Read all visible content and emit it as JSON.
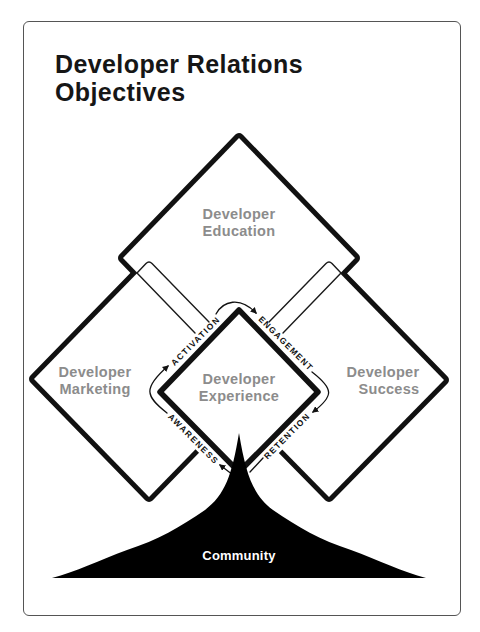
{
  "title": {
    "line1": "Developer Relations",
    "line2": "Objectives"
  },
  "diagram": {
    "areas": {
      "education": {
        "line1": "Developer",
        "line2": "Education"
      },
      "marketing": {
        "line1": "Developer",
        "line2": "Marketing"
      },
      "success": {
        "line1": "Developer",
        "line2": "Success"
      },
      "experience": {
        "line1": "Developer",
        "line2": "Experience"
      }
    },
    "stages": {
      "activation": "ACTIVATION",
      "engagement": "ENGAGEMENT",
      "retention": "RETENTION",
      "awareness": "AWARENESS"
    },
    "foundation": "Community"
  },
  "colors": {
    "stroke": "#111111",
    "area_label": "#8c8c8c",
    "card_border": "#555555",
    "community_fill": "#000000",
    "community_text": "#ffffff"
  }
}
